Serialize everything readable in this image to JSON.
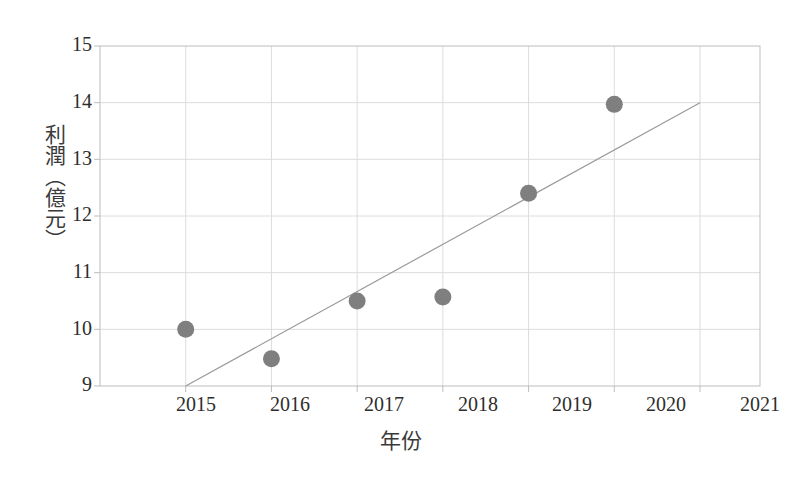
{
  "chart_data": {
    "type": "scatter",
    "title": "",
    "subtitle": "",
    "xlabel": "年份",
    "ylabel": "利潤（億元）",
    "x": [
      2015,
      2016,
      2017,
      2018,
      2019,
      2020
    ],
    "values": [
      10.0,
      9.48,
      10.5,
      10.57,
      12.4,
      13.97
    ],
    "series": [
      {
        "name": "利潤",
        "type": "scatter",
        "x": [
          2015,
          2016,
          2017,
          2018,
          2019,
          2020
        ],
        "values": [
          10.0,
          9.48,
          10.5,
          10.57,
          12.4,
          13.97
        ],
        "marker": "circle",
        "color": "#7f7f7f"
      },
      {
        "name": "趨勢線",
        "type": "line",
        "x": [
          2015,
          2021
        ],
        "values": [
          9.0,
          14.0
        ],
        "color": "#9a9a9a"
      }
    ],
    "xlim": [
      2014.0,
      2021.7
    ],
    "ylim": [
      9,
      15
    ],
    "xticks": [
      2015,
      2016,
      2017,
      2018,
      2019,
      2020,
      2021
    ],
    "xtick_labels": [
      "2015",
      "2016",
      "2017",
      "2018",
      "2019",
      "2020",
      "2021"
    ],
    "yticks": [
      9,
      10,
      11,
      12,
      13,
      14,
      15
    ],
    "ytick_labels": [
      "9",
      "10",
      "11",
      "12",
      "13",
      "14",
      "15"
    ],
    "grid": true,
    "legend": false,
    "legend_position": "none",
    "colors": {
      "marker": "#7f7f7f",
      "trendline": "#9a9a9a",
      "grid": "#dcdcdc",
      "axis": "#bdbdbd",
      "text": "#2e2e2e",
      "background": "#ffffff"
    }
  }
}
